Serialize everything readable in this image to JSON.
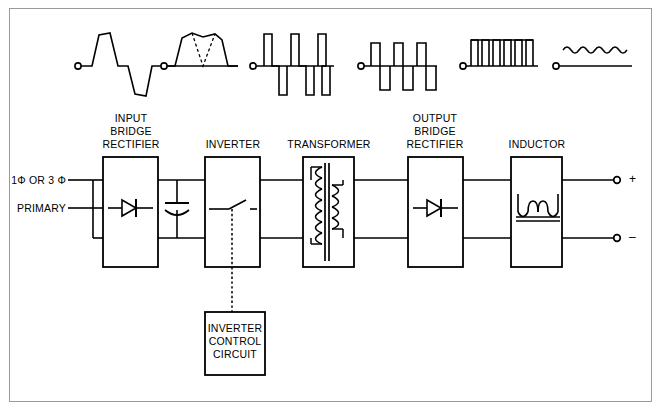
{
  "diagram": {
    "frame_color": "#9a9a9a",
    "line_color": "#000000",
    "background": "#ffffff"
  },
  "waveforms": [
    {
      "id": "wf-sine",
      "name": "ac-sine-wave",
      "caption": ""
    },
    {
      "id": "wf-rectified",
      "name": "rectified-dc-ripple-wave",
      "caption": ""
    },
    {
      "id": "wf-pwm-narrow",
      "name": "bipolar-narrow-pwm-wave",
      "caption": ""
    },
    {
      "id": "wf-pwm-wide",
      "name": "bipolar-wide-square-wave",
      "caption": ""
    },
    {
      "id": "wf-unipolar-pulses",
      "name": "unipolar-rectified-pulse-wave",
      "caption": ""
    },
    {
      "id": "wf-dc-ripple",
      "name": "filtered-dc-ripple-wave",
      "caption": ""
    }
  ],
  "blocks": [
    {
      "id": "input-bridge-rectifier",
      "label_lines": [
        "INPUT",
        "BRIDGE",
        "RECTIFIER"
      ],
      "symbol": "diode"
    },
    {
      "id": "inverter",
      "label_lines": [
        "INVERTER"
      ],
      "symbol": "switch"
    },
    {
      "id": "transformer",
      "label_lines": [
        "TRANSFORMER"
      ],
      "symbol": "transformer"
    },
    {
      "id": "output-bridge-rectifier",
      "label_lines": [
        "OUTPUT",
        "BRIDGE",
        "RECTIFIER"
      ],
      "symbol": "diode"
    },
    {
      "id": "inductor",
      "label_lines": [
        "INDUCTOR"
      ],
      "symbol": "inductor"
    }
  ],
  "control_block": {
    "id": "inverter-control-circuit",
    "label_lines": [
      "INVERTER",
      "CONTROL",
      "CIRCUIT"
    ]
  },
  "labels": {
    "input_phase": "1Φ OR 3 Φ",
    "input_primary": "PRIMARY",
    "block_input_bridge_1": "INPUT",
    "block_input_bridge_2": "BRIDGE",
    "block_input_bridge_3": "RECTIFIER",
    "block_inverter": "INVERTER",
    "block_transformer": "TRANSFORMER",
    "block_output_bridge_1": "OUTPUT",
    "block_output_bridge_2": "BRIDGE",
    "block_output_bridge_3": "RECTIFIER",
    "block_inductor": "INDUCTOR",
    "control_1": "INVERTER",
    "control_2": "CONTROL",
    "control_3": "CIRCUIT",
    "terminal_positive": "+",
    "terminal_negative": "–"
  },
  "components": {
    "capacitor": "dc-bus-filter-capacitor",
    "switch": "inverter-switch",
    "diode_input": "input-rectifier-diode",
    "diode_output": "output-rectifier-diode",
    "transformer_core": "transformer-core",
    "inductor_core": "inductor-core"
  }
}
